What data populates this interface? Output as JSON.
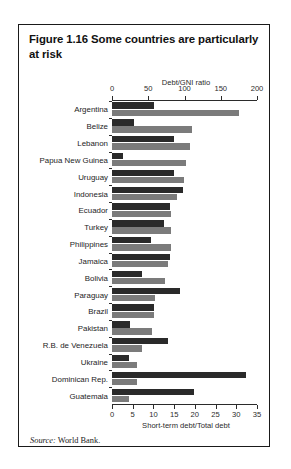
{
  "figure": {
    "title": "Figure 1.16  Some countries are particularly at risk",
    "source_label": "Source:",
    "source_text": "World Bank."
  },
  "chart_data": {
    "type": "bar",
    "orientation": "horizontal",
    "title": "Figure 1.16  Some countries are particularly at risk",
    "top_axis_label": "Debt/GNI ratio",
    "bottom_axis_label": "Short-term debt/Total debt",
    "top_axis": {
      "label": "Debt/GNI ratio",
      "min": 0,
      "max": 200,
      "ticks": [
        0,
        50,
        100,
        150,
        200
      ],
      "ticklabels": [
        "0",
        "50",
        "100",
        "150",
        "200"
      ]
    },
    "bottom_axis": {
      "label": "Short-term debt/Total debt",
      "min": 0,
      "max": 35,
      "ticks": [
        0,
        5,
        10,
        15,
        20,
        25,
        30,
        35
      ],
      "ticklabels": [
        "0",
        "5",
        "10",
        "15",
        "20",
        "25",
        "30",
        "35"
      ]
    },
    "grid": false,
    "legend": "none",
    "categories": [
      "Argentina",
      "Belize",
      "Lebanon",
      "Papua New Guinea",
      "Uruguay",
      "Indonesia",
      "Ecuador",
      "Turkey",
      "Philippines",
      "Jamaica",
      "Bolivia",
      "Paraguay",
      "Brazil",
      "Pakistan",
      "R.B. de Venezuela",
      "Ukraine",
      "Dominican Rep.",
      "Guatemala"
    ],
    "series": [
      {
        "name": "Short-term debt/Total debt",
        "axis": "bottom",
        "color": "#2a2a2a",
        "values": [
          10.2,
          5.4,
          15.0,
          2.6,
          14.9,
          17.2,
          14.1,
          12.5,
          9.4,
          14.0,
          7.3,
          16.4,
          10.2,
          4.4,
          13.4,
          4.1,
          32.3,
          19.9
        ]
      },
      {
        "name": "Debt/GNI ratio",
        "axis": "top",
        "color": "#7b7b7b",
        "values": [
          175,
          110,
          107,
          102,
          99,
          89,
          81,
          81,
          81,
          77,
          73,
          59,
          58,
          55,
          42,
          35,
          34,
          23
        ]
      }
    ]
  }
}
